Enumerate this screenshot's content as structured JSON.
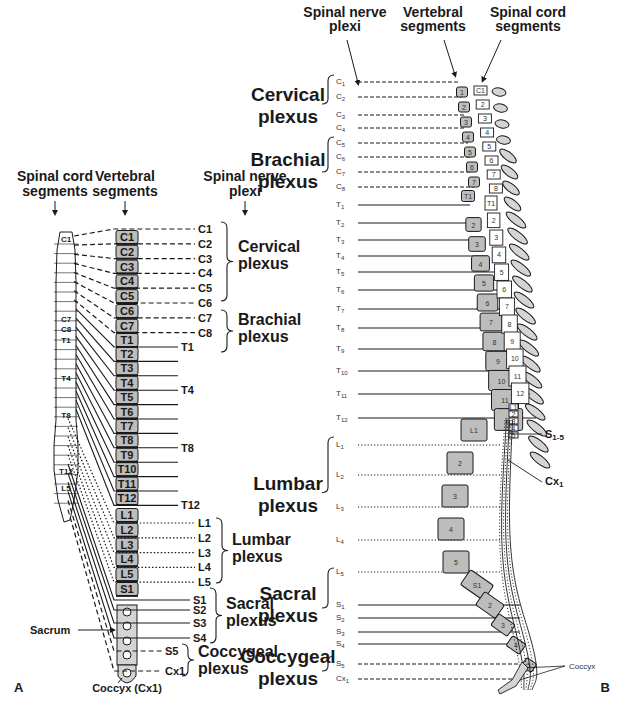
{
  "panel_a": {
    "label": "A",
    "headers": {
      "cord": [
        "Spinal cord",
        "segments"
      ],
      "vertebral": [
        "Vertebral",
        "segments"
      ],
      "plexi": [
        "Spinal nerve",
        "plexi"
      ]
    },
    "cord_segment_labels": [
      "C1",
      "C7",
      "C8",
      "T1",
      "T4",
      "T8",
      "T12",
      "L5"
    ],
    "vertebrae": [
      "C1",
      "C2",
      "C3",
      "C4",
      "C5",
      "C6",
      "C7",
      "T1",
      "T2",
      "T3",
      "T4",
      "T5",
      "T6",
      "T7",
      "T8",
      "T9",
      "T10",
      "T11",
      "T12",
      "L1",
      "L2",
      "L3",
      "L4",
      "L5",
      "S1"
    ],
    "nerves": [
      {
        "label": "C1",
        "style": "dashed"
      },
      {
        "label": "C2",
        "style": "dashed"
      },
      {
        "label": "C3",
        "style": "dashed"
      },
      {
        "label": "C4",
        "style": "dashed"
      },
      {
        "label": "C5",
        "style": "dashed"
      },
      {
        "label": "C6",
        "style": "dashed"
      },
      {
        "label": "C7",
        "style": "dashed"
      },
      {
        "label": "C8",
        "style": "dashed"
      },
      {
        "label": "T1",
        "style": "solid"
      },
      {
        "label": "",
        "style": "solid"
      },
      {
        "label": "",
        "style": "solid"
      },
      {
        "label": "T4",
        "style": "solid"
      },
      {
        "label": "",
        "style": "solid"
      },
      {
        "label": "",
        "style": "solid"
      },
      {
        "label": "",
        "style": "solid"
      },
      {
        "label": "T8",
        "style": "solid"
      },
      {
        "label": "",
        "style": "solid"
      },
      {
        "label": "",
        "style": "solid"
      },
      {
        "label": "",
        "style": "solid"
      },
      {
        "label": "T12",
        "style": "solid"
      },
      {
        "label": "L1",
        "style": "dotted"
      },
      {
        "label": "L2",
        "style": "dotted"
      },
      {
        "label": "L3",
        "style": "dotted"
      },
      {
        "label": "L4",
        "style": "dotted"
      },
      {
        "label": "L5",
        "style": "dotted"
      },
      {
        "label": "S1",
        "style": "solid"
      },
      {
        "label": "S2",
        "style": "solid"
      },
      {
        "label": "S3",
        "style": "solid"
      },
      {
        "label": "S4",
        "style": "solid"
      },
      {
        "label": "S5",
        "style": "dashed"
      },
      {
        "label": "Cx1",
        "style": "dashed"
      }
    ],
    "plexi": [
      {
        "name": [
          "Cervical",
          "plexus"
        ]
      },
      {
        "name": [
          "Brachial",
          "plexus"
        ]
      },
      {
        "name": [
          "Lumbar",
          "plexus"
        ]
      },
      {
        "name": [
          "Sacral",
          "plexus"
        ]
      },
      {
        "name": [
          "Coccygeal",
          "plexus"
        ]
      }
    ],
    "annotations": {
      "sacrum": "Sacrum",
      "coccyx": "Coccyx (Cx1)"
    }
  },
  "panel_b": {
    "label": "B",
    "headers": {
      "plexi": [
        "Spinal nerve",
        "plexi"
      ],
      "vertebral": [
        "Vertebral",
        "segments"
      ],
      "cord": [
        "Spinal cord",
        "segments"
      ]
    },
    "plexi": [
      {
        "name": [
          "Cervical",
          "plexus"
        ]
      },
      {
        "name": [
          "Brachial",
          "plexus"
        ]
      },
      {
        "name": [
          "Lumbar",
          "plexus"
        ]
      },
      {
        "name": [
          "Sacral",
          "plexus"
        ]
      },
      {
        "name": [
          "Coccygeal",
          "plexus"
        ]
      }
    ],
    "nerve_labels": [
      "C1",
      "C2",
      "C3",
      "C4",
      "C5",
      "C6",
      "C7",
      "C8",
      "T1",
      "T2",
      "T3",
      "T4",
      "T5",
      "T6",
      "T7",
      "T8",
      "T9",
      "T10",
      "T11",
      "T12",
      "L1",
      "L2",
      "L3",
      "L4",
      "L5",
      "S1",
      "S2",
      "S3",
      "S4",
      "S5",
      "Cx1"
    ],
    "vertebral_bodies": [
      "1",
      "2",
      "3",
      "4",
      "5",
      "6",
      "7",
      "T1",
      "2",
      "3",
      "4",
      "5",
      "6",
      "7",
      "8",
      "9",
      "10",
      "11",
      "12",
      "L1",
      "2",
      "3",
      "4",
      "5",
      "S1",
      "2",
      "3",
      "4",
      "5"
    ],
    "cord_segments": [
      "C1",
      "2",
      "3",
      "4",
      "5",
      "6",
      "7",
      "8",
      "T1",
      "2",
      "3",
      "4",
      "5",
      "6",
      "7",
      "8",
      "9",
      "10",
      "11",
      "12",
      "L1",
      "2",
      "3",
      "4",
      "5"
    ],
    "annotations": {
      "s15": "S1-5",
      "cx1": "Cx1",
      "coccyx": "Coccyx"
    }
  },
  "colors": {
    "bone": "#bdbdbd",
    "bone_light": "#d4d4d4",
    "ink": "#1a1a1a",
    "background": "#ffffff"
  }
}
